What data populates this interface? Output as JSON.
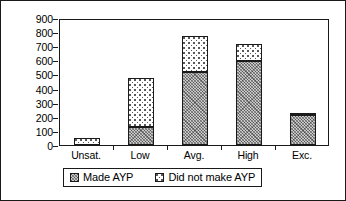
{
  "chart_data": {
    "type": "bar",
    "subtype": "stacked-bar",
    "title": "",
    "xlabel": "",
    "ylabel": "",
    "categories": [
      "Unsat.",
      "Low",
      "Avg.",
      "High",
      "Exc."
    ],
    "series": [
      {
        "name": "Made AYP",
        "values": [
          0,
          130,
          520,
          595,
          215
        ]
      },
      {
        "name": "Did not make AYP",
        "values": [
          50,
          345,
          255,
          120,
          10
        ]
      }
    ],
    "totals": [
      50,
      475,
      775,
      715,
      225
    ],
    "ylim": [
      0,
      900
    ],
    "ytick_step": 100,
    "yticks": [
      "900",
      "800",
      "700",
      "600",
      "500",
      "400",
      "300",
      "200",
      "100",
      "0"
    ],
    "grid": false,
    "legend_position": "bottom",
    "colors": {
      "made_ayp_fill": "#c9c9c9",
      "did_not_make_ayp_fill": "#ffffff",
      "axis": "#1a1a1a",
      "background": "#ffffff"
    }
  },
  "legend": {
    "entries": [
      {
        "label": "Made AYP",
        "swatch": "hatched-swatch"
      },
      {
        "label": "Did not make AYP",
        "swatch": "dotted-swatch"
      }
    ]
  }
}
